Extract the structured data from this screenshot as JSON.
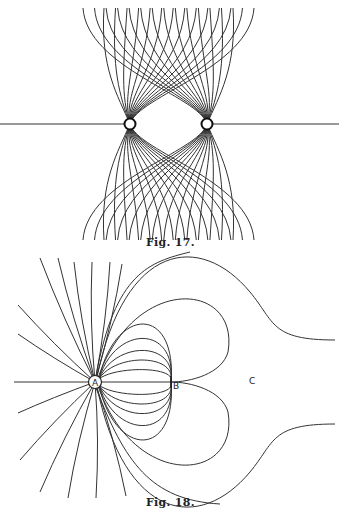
{
  "figures": [
    {
      "id": "fig17",
      "caption": "Fig. 17.",
      "description": "Lines of force between two like point charges",
      "charges": [
        {
          "x": 130,
          "y": 124
        },
        {
          "x": 207,
          "y": 124
        }
      ]
    },
    {
      "id": "fig18",
      "caption": "Fig. 18.",
      "description": "Lines of force from charge A with conductor B and region C",
      "labels": {
        "a": "A",
        "b": "B",
        "c": "C"
      }
    }
  ]
}
